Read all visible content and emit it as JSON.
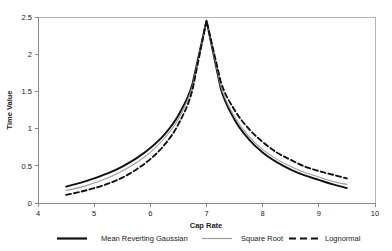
{
  "chart_data": {
    "type": "line",
    "title": "",
    "xlabel": "Cap Rate",
    "ylabel": "Time Value",
    "xlim": [
      4,
      10
    ],
    "ylim": [
      0,
      2.5
    ],
    "xticks": [
      "4",
      "5",
      "6",
      "7",
      "8",
      "9",
      "10"
    ],
    "yticks": [
      "0",
      "0.5",
      "1",
      "1.5",
      "2",
      "2.5"
    ],
    "grid": false,
    "legend_position": "bottom",
    "x": [
      4.5,
      4.75,
      5,
      5.25,
      5.5,
      5.75,
      6,
      6.25,
      6.5,
      6.75,
      7,
      7.25,
      7.5,
      7.75,
      8,
      8.25,
      8.5,
      8.75,
      9,
      9.25,
      9.5
    ],
    "series": [
      {
        "name": "Mean Reverting Gaussian",
        "color": "#111111",
        "style": "solid",
        "width": 1.9,
        "values": [
          0.22,
          0.27,
          0.33,
          0.4,
          0.49,
          0.6,
          0.74,
          0.92,
          1.18,
          1.6,
          2.45,
          1.55,
          1.12,
          0.86,
          0.68,
          0.55,
          0.45,
          0.37,
          0.31,
          0.25,
          0.2
        ]
      },
      {
        "name": "Square Root",
        "color": "#9a9a9a",
        "style": "solid",
        "width": 1.1,
        "values": [
          0.17,
          0.21,
          0.27,
          0.34,
          0.43,
          0.54,
          0.68,
          0.87,
          1.13,
          1.57,
          2.45,
          1.58,
          1.16,
          0.9,
          0.72,
          0.59,
          0.49,
          0.41,
          0.35,
          0.29,
          0.25
        ]
      },
      {
        "name": "Lognormal",
        "color": "#111111",
        "style": "dashed",
        "width": 1.9,
        "values": [
          0.11,
          0.15,
          0.2,
          0.26,
          0.34,
          0.45,
          0.59,
          0.78,
          1.06,
          1.52,
          2.45,
          1.64,
          1.25,
          1.0,
          0.82,
          0.68,
          0.58,
          0.49,
          0.43,
          0.38,
          0.33
        ]
      }
    ],
    "legend": [
      {
        "label": "Mean Reverting Gaussian",
        "color": "#111111",
        "style": "solid",
        "width": 2.2
      },
      {
        "label": "Square Root",
        "color": "#9a9a9a",
        "style": "solid",
        "width": 1.2
      },
      {
        "label": "Lognormal",
        "color": "#111111",
        "style": "dashed",
        "width": 2.2
      }
    ]
  }
}
